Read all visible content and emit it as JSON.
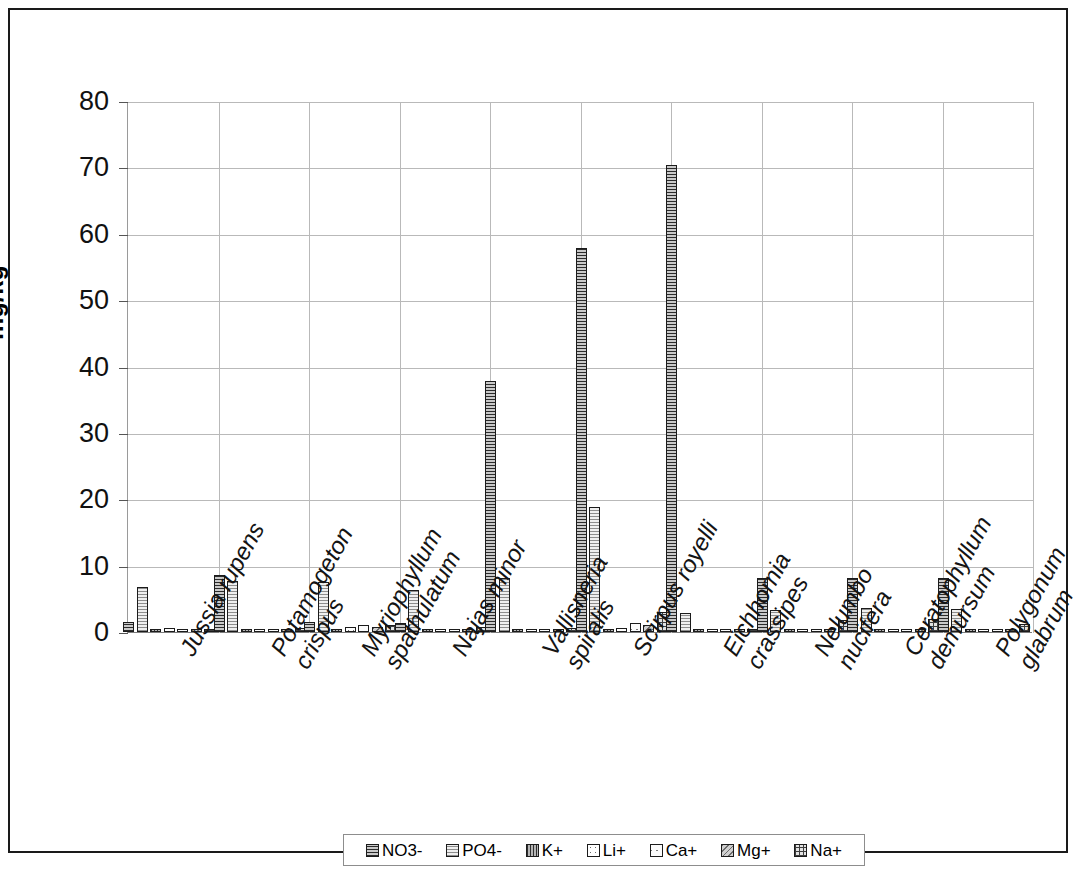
{
  "chart_data": {
    "type": "bar",
    "title": "",
    "xlabel": "",
    "ylabel": "mg/kg",
    "ylim": [
      0,
      80
    ],
    "yticks": [
      0,
      10,
      20,
      30,
      40,
      50,
      60,
      70,
      80
    ],
    "ytick_labels": [
      "0",
      "10",
      "20",
      "30",
      "40",
      "50",
      "60",
      "70",
      "80"
    ],
    "grid": "horizontal-and-vertical",
    "legend_position": "bottom",
    "categories": [
      "Jussia rupens",
      "Potamogeton crispus",
      "Myriophyllum spathulatum",
      "Najas minor",
      "Vallisneria spiralis",
      "Scirpus royelli",
      "Eichhornia crassipes",
      "Nelumbo nucifera",
      "Ceratophyllum demursum",
      "Polygonum glabrum"
    ],
    "category_lines": [
      [
        "Jussia rupens"
      ],
      [
        "Potamogeton",
        "crispus"
      ],
      [
        "Myriophyllum",
        "spathulatum"
      ],
      [
        "Najas minor"
      ],
      [
        "Vallisneria",
        "spiralis"
      ],
      [
        "Scirpus royelli"
      ],
      [
        "Eichhornia",
        "crassipes"
      ],
      [
        "Nelumbo",
        "nucifera"
      ],
      [
        "Ceratophyllum",
        "demursum"
      ],
      [
        "Polygonum",
        "glabrum"
      ]
    ],
    "series": [
      {
        "name": "NO3-",
        "values": [
          1.5,
          8.6,
          1.5,
          1.3,
          37.8,
          57.8,
          70.3,
          8.1,
          8.1,
          8.1
        ]
      },
      {
        "name": "PO4-",
        "values": [
          6.8,
          7.7,
          7.5,
          6.3,
          8.2,
          18.8,
          2.9,
          3.3,
          3.6,
          3.4
        ]
      },
      {
        "name": "K+",
        "values": [
          0.2,
          0.2,
          0.2,
          0.1,
          0.2,
          0.3,
          0.1,
          0.1,
          0.2,
          0.2
        ]
      },
      {
        "name": "Li+",
        "values": [
          0.6,
          0.5,
          0.8,
          0.2,
          0.5,
          0.6,
          0.2,
          0.3,
          0.4,
          0.3
        ]
      },
      {
        "name": "Ca+",
        "values": [
          0.3,
          0.4,
          1.0,
          0.2,
          0.4,
          1.4,
          0.2,
          0.2,
          0.3,
          0.3
        ]
      },
      {
        "name": "Mg+",
        "values": [
          0.3,
          0.3,
          0.7,
          0.1,
          0.3,
          1.1,
          0.1,
          0.2,
          0.2,
          0.2
        ]
      },
      {
        "name": "Na+",
        "values": [
          0.5,
          0.6,
          1.1,
          0.8,
          0.6,
          3.0,
          0.3,
          1.8,
          2.0,
          1.2
        ]
      }
    ]
  },
  "legend": {
    "items": [
      {
        "label": "NO3-"
      },
      {
        "label": "PO4-"
      },
      {
        "label": "K+"
      },
      {
        "label": "Li+"
      },
      {
        "label": "Ca+"
      },
      {
        "label": "Mg+"
      },
      {
        "label": "Na+"
      }
    ]
  }
}
